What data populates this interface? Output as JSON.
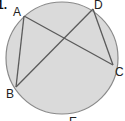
{
  "figure": {
    "problem_number": "1.",
    "circle": {
      "cx": 62,
      "cy": 58,
      "r": 56,
      "fill": "#dadada",
      "stroke": "#8a8a8a"
    },
    "points": [
      {
        "name": "A",
        "x": 24,
        "y": 16,
        "lx": 14,
        "ly": 15
      },
      {
        "name": "D",
        "x": 93,
        "y": 9,
        "lx": 95,
        "ly": 8
      },
      {
        "name": "C",
        "x": 113,
        "y": 65,
        "lx": 115,
        "ly": 75
      },
      {
        "name": "B",
        "x": 16,
        "y": 87,
        "lx": 6,
        "ly": 98
      },
      {
        "name": "E",
        "x": 73,
        "y": 121,
        "lx": 70,
        "ly": 125
      }
    ],
    "chords": [
      {
        "from": "A",
        "to": "C"
      },
      {
        "from": "D",
        "to": "B"
      },
      {
        "from": "A",
        "to": "B"
      },
      {
        "from": "D",
        "to": "C"
      }
    ],
    "line_color": "#5a5a5a"
  }
}
